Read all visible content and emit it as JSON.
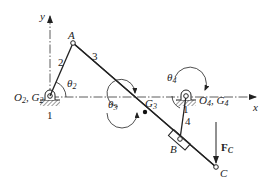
{
  "axes": {
    "x_label": "x",
    "y_label": "y"
  },
  "points": {
    "O2": {
      "label": "O",
      "sub": "2",
      "label2": "G",
      "sub2": "2"
    },
    "A": {
      "label": "A"
    },
    "G3": {
      "label": "G",
      "sub": "3"
    },
    "O4": {
      "label": "O",
      "sub": "4",
      "label2": "G",
      "sub2": "4"
    },
    "B": {
      "label": "B"
    },
    "C": {
      "label": "C"
    }
  },
  "links": [
    {
      "id": "ground-left",
      "label": "1"
    },
    {
      "id": "crank",
      "label": "2"
    },
    {
      "id": "coupler",
      "label": "3"
    },
    {
      "id": "rocker",
      "label": "4"
    },
    {
      "id": "ground-right",
      "label": "1"
    }
  ],
  "angles": [
    {
      "id": "theta2",
      "label": "θ",
      "sub": "2"
    },
    {
      "id": "theta3",
      "label": "θ",
      "sub": "3"
    },
    {
      "id": "theta4",
      "label": "θ",
      "sub": "4"
    }
  ],
  "force": {
    "label": "F",
    "sub": "C"
  },
  "colors": {
    "ink": "#222222",
    "background": "#ffffff",
    "ground_hatch": "#555555"
  }
}
